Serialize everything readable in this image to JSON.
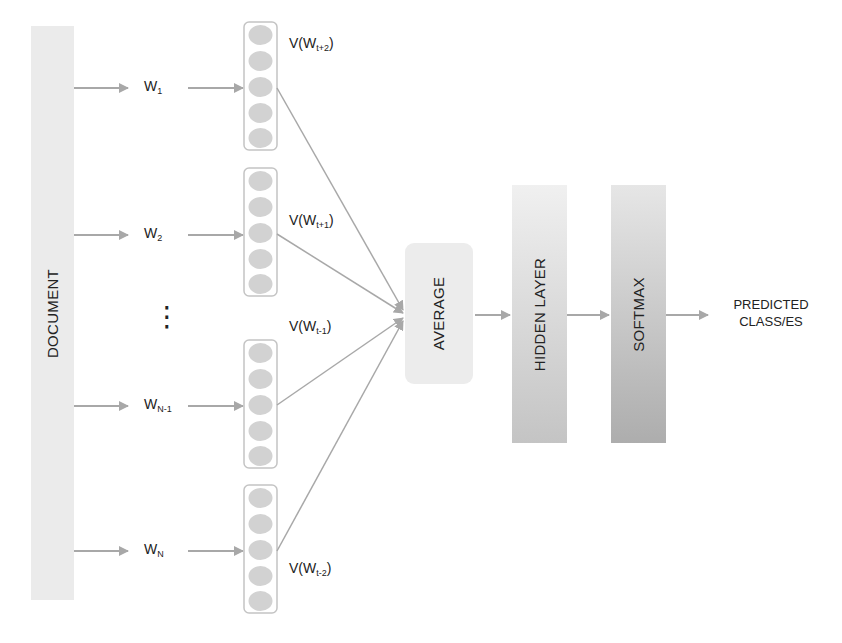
{
  "diagram": {
    "document_label": "DOCUMENT",
    "words": [
      {
        "base": "W",
        "sub": "1",
        "y": 88
      },
      {
        "base": "W",
        "sub": "2",
        "y": 235
      },
      {
        "base": "W",
        "sub": "N-1",
        "y": 406
      },
      {
        "base": "W",
        "sub": "N",
        "y": 551
      }
    ],
    "ellipsis": "⋮",
    "vectors": [
      {
        "label_base": "V(W",
        "label_sub": "t+2",
        "label_close": ")",
        "top": 22
      },
      {
        "label_base": "V(W",
        "label_sub": "t+1",
        "label_close": ")",
        "top": 168
      },
      {
        "label_base": "V(W",
        "label_sub": "t-1",
        "label_close": ")",
        "top": 340
      },
      {
        "label_base": "V(W",
        "label_sub": "t-2",
        "label_close": ")",
        "top": 485
      }
    ],
    "average_label": "AVERAGE",
    "hidden_layer_label": "HIDDEN LAYER",
    "softmax_label": "SOFTMAX",
    "output_label_line1": "PREDICTED",
    "output_label_line2": "CLASS/ES",
    "colors": {
      "block_light": "#ebebeb",
      "block_mid": "#d6d6d6",
      "block_dark": "#b4b4b4",
      "arrow": "#a8a8a8",
      "node_fill": "#d2d2d2",
      "node_border": "#c4c4c4",
      "text": "#222222"
    }
  }
}
